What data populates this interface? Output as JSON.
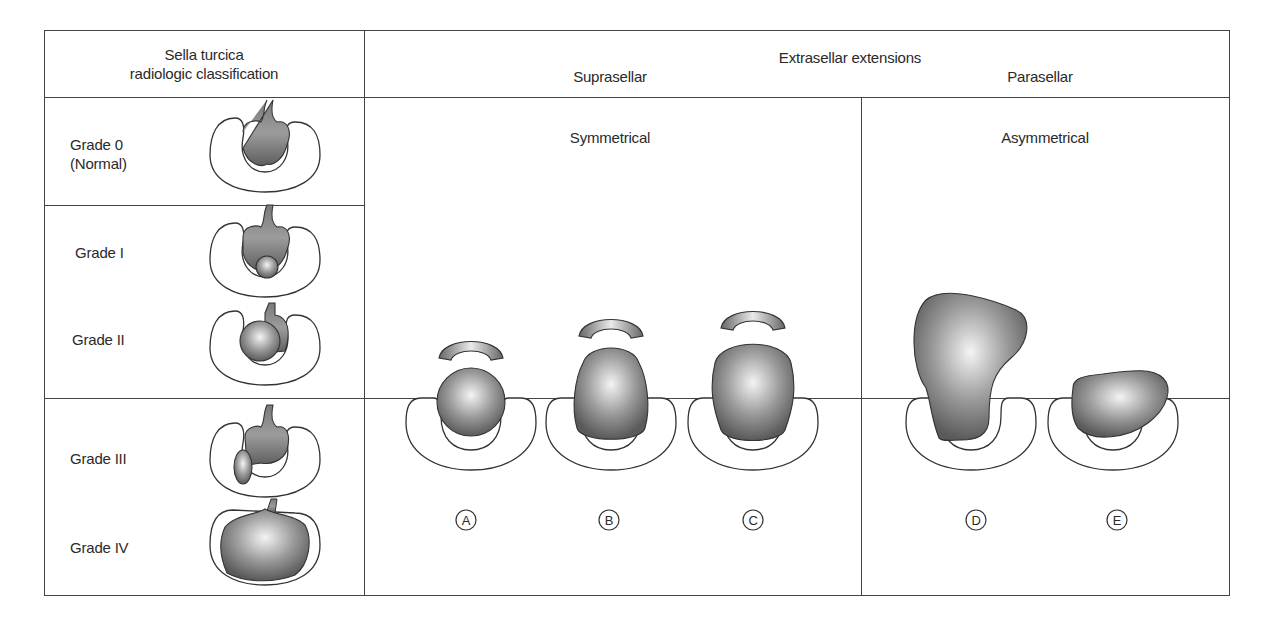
{
  "left_panel": {
    "header_line1": "Sella turcica",
    "header_line2": "radiologic classification",
    "grades": [
      {
        "label": "Grade 0",
        "sublabel": "(Normal)"
      },
      {
        "label": "Grade I"
      },
      {
        "label": "Grade II"
      },
      {
        "label": "Grade III"
      },
      {
        "label": "Grade IV"
      }
    ]
  },
  "right_panel": {
    "header_title": "Extrasellar extensions",
    "header_left": "Suprasellar",
    "header_right": "Parasellar",
    "section_symmetrical": "Symmetrical",
    "section_asymmetrical": "Asymmetrical",
    "figure_labels": [
      "A",
      "B",
      "C",
      "D",
      "E"
    ]
  },
  "colors": {
    "line": "#444444",
    "tumor_dark": "#5a5a5a",
    "tumor_light": "#f4f4f4"
  }
}
